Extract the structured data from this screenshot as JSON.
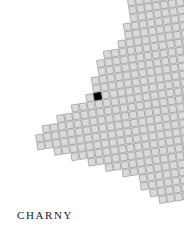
{
  "map": {
    "label": "CHARNY",
    "type": "grid-cell-cartogram",
    "cell_colors": {
      "fill": "#dadada",
      "stroke": "#9a9a9a",
      "highlight_fill": "#000000",
      "highlight_stroke": "#000000",
      "background": "#ffffff"
    },
    "cell_size_px": 7.1,
    "cell_gap_px": 0.9,
    "lattice_rotation_deg": -9,
    "origin_px": {
      "x": 16,
      "y": 8
    },
    "highlight_cell": {
      "row": 12,
      "col": 8
    },
    "rows": [
      {
        "row": 0,
        "start": 14,
        "end": 18
      },
      {
        "row": 1,
        "start": 14,
        "end": 19
      },
      {
        "row": 2,
        "start": 14,
        "end": 20
      },
      {
        "row": 3,
        "start": 14,
        "end": 21
      },
      {
        "row": 4,
        "start": 13,
        "end": 21
      },
      {
        "row": 5,
        "start": 13,
        "end": 21
      },
      {
        "row": 6,
        "start": 12,
        "end": 21
      },
      {
        "row": 7,
        "start": 10,
        "end": 21
      },
      {
        "row": 8,
        "start": 9,
        "end": 21
      },
      {
        "row": 9,
        "start": 9,
        "end": 21
      },
      {
        "row": 10,
        "start": 8,
        "end": 21
      },
      {
        "row": 11,
        "start": 8,
        "end": 21
      },
      {
        "row": 12,
        "start": 7,
        "end": 21
      },
      {
        "row": 13,
        "start": 5,
        "end": 20
      },
      {
        "row": 14,
        "start": 3,
        "end": 20
      },
      {
        "row": 15,
        "start": 1,
        "end": 20
      },
      {
        "row": 16,
        "start": 0,
        "end": 20
      },
      {
        "row": 17,
        "start": 0,
        "end": 19
      },
      {
        "row": 18,
        "start": 2,
        "end": 19
      },
      {
        "row": 19,
        "start": 4,
        "end": 19
      },
      {
        "row": 20,
        "start": 6,
        "end": 18
      },
      {
        "row": 21,
        "start": 8,
        "end": 18
      },
      {
        "row": 22,
        "start": 10,
        "end": 18
      },
      {
        "row": 23,
        "start": 12,
        "end": 18
      },
      {
        "row": 24,
        "start": 12,
        "end": 17
      },
      {
        "row": 25,
        "start": 13,
        "end": 17
      },
      {
        "row": 26,
        "start": 14,
        "end": 17
      }
    ]
  }
}
